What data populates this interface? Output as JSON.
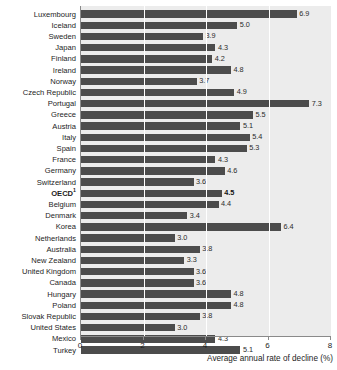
{
  "chart_data": {
    "type": "bar",
    "orientation": "horizontal",
    "title": "",
    "xlabel": "Average annual rate of decline (%)",
    "ylabel": "",
    "xlim": [
      0,
      8
    ],
    "xticks": [
      0,
      2,
      4,
      6,
      8
    ],
    "xticklabels": [
      "0",
      "2",
      "4",
      "6",
      "8"
    ],
    "grid": true,
    "legend": null,
    "bar_color": "#4c4c4c",
    "plot_background": "#ececec",
    "categories": [
      "Luxembourg",
      "Iceland",
      "Sweden",
      "Japan",
      "Finland",
      "Ireland",
      "Norway",
      "Czech Republic",
      "Portugal",
      "Greece",
      "Austria",
      "Italy",
      "Spain",
      "France",
      "Germany",
      "Switzerland",
      "OECD",
      "Belgium",
      "Denmark",
      "Korea",
      "Netherlands",
      "Australia",
      "New Zealand",
      "United Kingdom",
      "Canada",
      "Hungary",
      "Poland",
      "Slovak Republic",
      "United States",
      "Mexico",
      "Turkey"
    ],
    "values": [
      6.9,
      5.0,
      3.9,
      4.3,
      4.2,
      4.8,
      3.7,
      4.9,
      7.3,
      5.5,
      5.1,
      5.4,
      5.3,
      4.3,
      4.6,
      3.6,
      4.5,
      4.4,
      3.4,
      6.4,
      3.0,
      3.8,
      3.3,
      3.6,
      3.6,
      4.8,
      4.8,
      3.8,
      3.0,
      4.3,
      5.1
    ],
    "value_labels": [
      "6.9",
      "5.0",
      "3.9",
      "4.3",
      "4.2",
      "4.8",
      "3.7",
      "4.9",
      "7.3",
      "5.5",
      "5.1",
      "5.4",
      "5.3",
      "4.3",
      "4.6",
      "3.6",
      "4.5",
      "4.4",
      "3.4",
      "6.4",
      "3.0",
      "3.8",
      "3.3",
      "3.6",
      "3.6",
      "4.8",
      "4.8",
      "3.8",
      "3.0",
      "4.3",
      "5.1"
    ],
    "highlight_index": 16,
    "highlight_footnote_marker": "1"
  }
}
